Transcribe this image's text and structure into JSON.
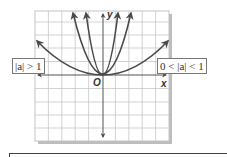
{
  "diagram": {
    "type": "graph-of-parabolas",
    "grid": {
      "columns": 10,
      "rows": 10,
      "cell_px": 13.4
    },
    "axes": {
      "x_label": "x",
      "y_label": "y",
      "origin_label": "O"
    },
    "curves": [
      {
        "name": "narrow-parabola-1",
        "equation": "y = a x^2",
        "group": "|a| > 1"
      },
      {
        "name": "narrow-parabola-2",
        "equation": "y = a x^2",
        "group": "|a| > 1"
      },
      {
        "name": "wide-parabola",
        "equation": "y = a x^2",
        "group": "0 < |a| < 1"
      }
    ],
    "labels": {
      "left": "|a| > 1",
      "right": "0 < |a| < 1"
    },
    "colors": {
      "grid": "#bdbdbd",
      "curve": "#4a4a4a",
      "axis": "#555555",
      "shadow": "#b0b0b0"
    }
  }
}
